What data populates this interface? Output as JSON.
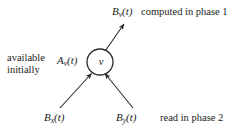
{
  "figure": {
    "background_color": "#ffffff",
    "stroke_color": "#2b2b2b",
    "node": {
      "name": "v",
      "label": "v",
      "center_x": 100,
      "center_y": 62,
      "radius": 13
    },
    "labels": {
      "outgoing_symbol_base": "B",
      "outgoing_symbol_sub": "v",
      "outgoing_symbol_arg": "(t)",
      "outgoing_note": "computed in phase 1",
      "available_symbol_base": "A",
      "available_symbol_sub": "v",
      "available_symbol_arg": "(t)",
      "available_note_line1": "available",
      "available_note_line2": "initially",
      "incoming_left_base": "B",
      "incoming_left_sub": "x",
      "incoming_left_arg": "(t)",
      "incoming_right_base": "B",
      "incoming_right_sub": "y",
      "incoming_right_arg": "(t)",
      "incoming_note": "read in phase 2"
    },
    "edges": [
      {
        "name": "outgoing-edge-bv",
        "direction": "out",
        "from_x": 105,
        "from_y": 50,
        "to_x": 124,
        "to_y": 24
      },
      {
        "name": "incoming-edge-bx",
        "direction": "in",
        "from_x": 60,
        "from_y": 108,
        "to_x": 92,
        "to_y": 74
      },
      {
        "name": "incoming-edge-by",
        "direction": "in",
        "from_x": 133,
        "from_y": 108,
        "to_x": 105,
        "to_y": 74
      }
    ]
  }
}
